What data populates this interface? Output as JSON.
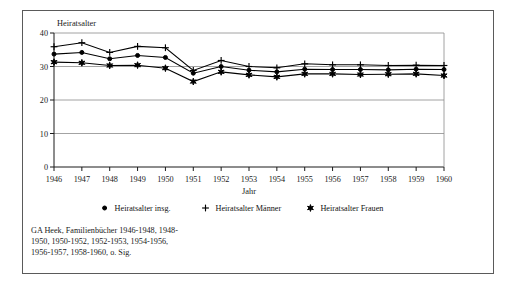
{
  "chart_data": {
    "type": "line",
    "title": "",
    "xlabel": "Jahr",
    "ylabel": "Heiratsalter",
    "grid": true,
    "legend_position": "bottom",
    "ylim": [
      0,
      40
    ],
    "yticks": [
      0,
      10,
      20,
      30,
      40
    ],
    "ytick_labels": [
      "0",
      "10",
      "20",
      "30",
      "40"
    ],
    "categories": [
      "1946",
      "1947",
      "1948",
      "1949",
      "1950",
      "1951",
      "1952",
      "1953",
      "1954",
      "1955",
      "1956",
      "1957",
      "1958",
      "1959",
      "1960"
    ],
    "x": [
      1946,
      1947,
      1948,
      1949,
      1950,
      1951,
      1952,
      1953,
      1954,
      1955,
      1956,
      1957,
      1958,
      1959,
      1960
    ],
    "series": [
      {
        "name": "Heiratsalter insg.",
        "marker": "diamond",
        "values": [
          33.7,
          34.2,
          32.3,
          33.3,
          32.7,
          28.0,
          30.0,
          28.9,
          28.4,
          29.2,
          29.1,
          29.1,
          29.0,
          29.2,
          29.1
        ]
      },
      {
        "name": "Heiratsalter Männer",
        "marker": "plus",
        "values": [
          35.9,
          37.1,
          34.2,
          36.0,
          35.6,
          28.8,
          31.8,
          30.0,
          29.6,
          30.8,
          30.5,
          30.5,
          30.3,
          30.4,
          30.3
        ]
      },
      {
        "name": "Heiratsalter Frauen",
        "marker": "star",
        "values": [
          31.3,
          31.1,
          30.3,
          30.4,
          29.5,
          25.5,
          28.4,
          27.5,
          26.9,
          27.8,
          27.8,
          27.6,
          27.7,
          27.8,
          27.3
        ]
      }
    ]
  },
  "axes": {
    "y_title": "Heiratsalter",
    "x_title": "Jahr",
    "y_tick_0": "0",
    "y_tick_10": "10",
    "y_tick_20": "20",
    "y_tick_30": "30",
    "y_tick_40": "40",
    "x_tick_1946": "1946",
    "x_tick_1947": "1947",
    "x_tick_1948": "1948",
    "x_tick_1949": "1949",
    "x_tick_1950": "1950",
    "x_tick_1951": "1951",
    "x_tick_1952": "1952",
    "x_tick_1953": "1953",
    "x_tick_1954": "1954",
    "x_tick_1955": "1955",
    "x_tick_1956": "1956",
    "x_tick_1957": "1957",
    "x_tick_1958": "1958",
    "x_tick_1959": "1959",
    "x_tick_1960": "1960"
  },
  "legend": {
    "item_1": "Heiratsalter insg.",
    "item_2": "Heiratsalter Männer",
    "item_3": "Heiratsalter Frauen"
  },
  "source": {
    "line_1": "GA Heek, Familienbücher 1946-1948, 1948-",
    "line_2": "1950, 1950-1952, 1952-1953, 1954-1956,",
    "line_3": "1956-1957, 1958-1960, o. Sig."
  },
  "colors": {
    "frame": "#5a5a5a",
    "axis": "#1a1a1a",
    "grid": "#8c8c8c",
    "series": "#000000",
    "background": "#ffffff"
  }
}
